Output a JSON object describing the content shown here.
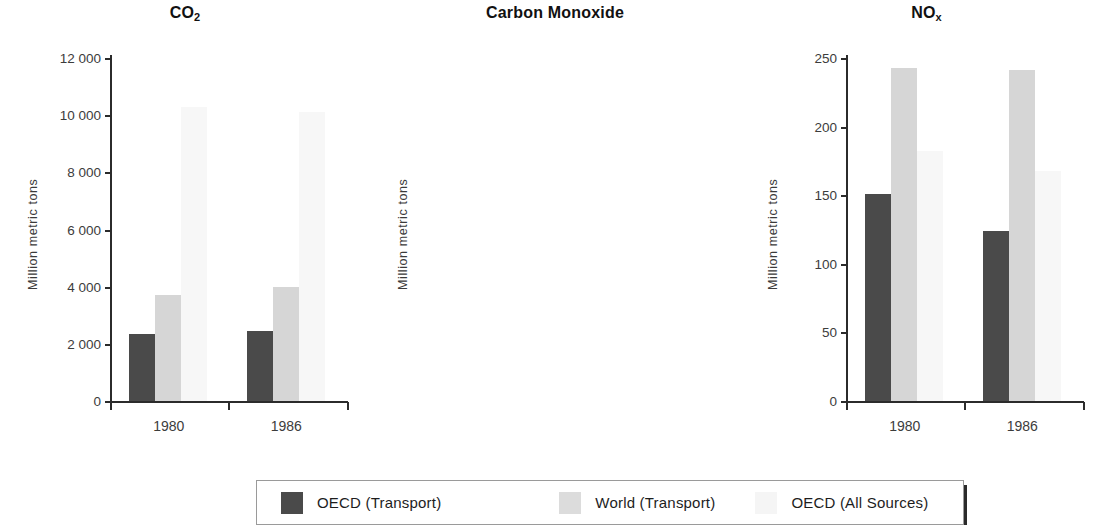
{
  "chart_data": [
    {
      "type": "bar",
      "title": "CO2",
      "title_base": "CO",
      "title_sub": "2",
      "xlabel": "",
      "ylabel": "Million metric tons",
      "categories": [
        "1980",
        "1986"
      ],
      "ylim": [
        0,
        12000
      ],
      "yticks": [
        0,
        2000,
        4000,
        6000,
        8000,
        10000,
        12000
      ],
      "ytick_labels": [
        "0",
        "2 000",
        "4 000",
        "6 000",
        "8 000",
        "10 000",
        "12 000"
      ],
      "grid": false,
      "legend_position": "bottom",
      "series": [
        {
          "name": "OECD (Transport)",
          "values": [
            2350,
            2450
          ]
        },
        {
          "name": "World (Transport)",
          "values": [
            3700,
            4000
          ]
        },
        {
          "name": "OECD (All Sources)",
          "values": [
            10300,
            10100
          ]
        }
      ]
    },
    {
      "type": "bar",
      "title": "Carbon Monoxide",
      "title_base": "Carbon Monoxide",
      "title_sub": "",
      "xlabel": "",
      "ylabel": "Million metric tons",
      "categories": [
        "1980",
        "1986"
      ],
      "ylim": [
        0,
        250
      ],
      "yticks": [
        0,
        50,
        100,
        150,
        200,
        250
      ],
      "ytick_labels": [
        "0",
        "50",
        "100",
        "150",
        "200",
        "250"
      ],
      "grid": false,
      "legend_position": "bottom",
      "series": [
        {
          "name": "OECD (Transport)",
          "values": [
            151,
            124
          ]
        },
        {
          "name": "World (Transport)",
          "values": [
            243,
            241
          ]
        },
        {
          "name": "OECD (All Sources)",
          "values": [
            182,
            168
          ]
        }
      ]
    },
    {
      "type": "bar",
      "title": "NOx",
      "title_base": "NO",
      "title_sub": "x",
      "xlabel": "",
      "ylabel": "Million metric tons",
      "categories": [
        "1980",
        "1986"
      ],
      "ylim": [
        0,
        60
      ],
      "yticks": [
        0,
        10,
        20,
        30,
        40,
        50,
        60
      ],
      "ytick_labels": [
        "0",
        "10",
        "20",
        "30",
        "40",
        "50",
        "60"
      ],
      "grid": false,
      "legend_position": "bottom",
      "series": [
        {
          "name": "OECD (Transport)",
          "values": [
            20.3,
            19.5
          ]
        },
        {
          "name": "World (Transport)",
          "values": [
            32.0,
            33.5
          ]
        },
        {
          "name": "OECD (All Sources)",
          "values": [
            40.5,
            38.0
          ]
        }
      ]
    }
  ],
  "legend": {
    "items": [
      {
        "label": "OECD (Transport)",
        "color": "#4a4a4a"
      },
      {
        "label": "World (Transport)",
        "color": "#dcdcdc"
      },
      {
        "label": "OECD (All Sources)",
        "color": "#f5f5f5"
      }
    ]
  },
  "colors": {
    "series_oecd_transport": "#4a4a4a",
    "series_world_transport": "#d6d6d6",
    "series_oecd_all_sources": "#f7f7f7",
    "axis": "#2b2b2b",
    "text": "#1a1a1a",
    "background": "#ffffff"
  }
}
